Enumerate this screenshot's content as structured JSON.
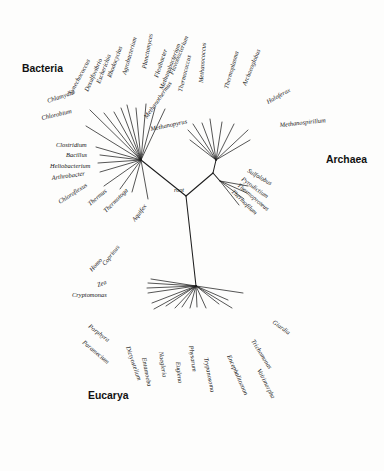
{
  "figure": {
    "type": "unrooted-phylogenetic-tree",
    "background_color": "#fdfdfc",
    "line_color": "#1d1d1d",
    "text_color": "#141414",
    "root_label": "root"
  },
  "domain_labels": [
    {
      "id": "bacteria",
      "text": "Bacteria",
      "x": 22,
      "y": 72
    },
    {
      "id": "archaea",
      "text": "Archaea",
      "x": 326,
      "y": 163
    },
    {
      "id": "eucarya",
      "text": "Eucarya",
      "x": 88,
      "y": 399
    }
  ],
  "nodes": {
    "root": {
      "x": 186,
      "y": 196,
      "label": "root",
      "label_x": 174,
      "label_y": 192
    },
    "bacteria_hub": {
      "x": 141,
      "y": 160
    },
    "archaea_hub": {
      "x": 213,
      "y": 173
    },
    "archaea_upper_hub": {
      "x": 216,
      "y": 160
    },
    "crenarchaeota_hub": {
      "x": 220,
      "y": 181
    },
    "eucarya_hub": {
      "x": 196,
      "y": 286
    },
    "eucarya_left_hub": {
      "x": 160,
      "y": 295
    }
  },
  "groups": [
    {
      "id": "bacteria",
      "label": "Bacteria",
      "hub": {
        "x": 141,
        "y": 160
      },
      "taxa": [
        {
          "name": "Chlamydia",
          "tx": 48,
          "ty": 103,
          "ex": 90,
          "ey": 110,
          "angle": -19
        },
        {
          "name": "Chlorobium",
          "tx": 42,
          "ty": 120,
          "ex": 86,
          "ey": 126,
          "angle": -13
        },
        {
          "name": "Synechococcus",
          "tx": 72,
          "ty": 95,
          "ex": 104,
          "ey": 113,
          "angle": -62
        },
        {
          "name": "Desulfovibrio",
          "tx": 88,
          "ty": 92,
          "ex": 114,
          "ey": 112,
          "angle": -66
        },
        {
          "name": "Escherichia",
          "tx": 100,
          "ty": 84,
          "ex": 121,
          "ey": 108,
          "angle": -69
        },
        {
          "name": "Rhodocyclus",
          "tx": 111,
          "ty": 78,
          "ex": 127,
          "ey": 105,
          "angle": -70
        },
        {
          "name": "Agrobacterium",
          "tx": 126,
          "ty": 75,
          "ex": 136,
          "ey": 108,
          "angle": -74
        },
        {
          "name": "Planctomyces",
          "tx": 146,
          "ty": 69,
          "ex": 146,
          "ey": 104,
          "angle": -79
        },
        {
          "name": "Flexibacter",
          "tx": 158,
          "ty": 78,
          "ex": 155,
          "ey": 108,
          "angle": -72
        },
        {
          "name": "Flavobacterium",
          "tx": 173,
          "ty": 75,
          "ex": 165,
          "ey": 109,
          "angle": -68
        },
        {
          "name": "Clostridium",
          "tx": 56,
          "ty": 147,
          "ex": 96,
          "ey": 147,
          "angle": 0
        },
        {
          "name": "Bacillus",
          "tx": 66,
          "ty": 157,
          "ex": 100,
          "ey": 155,
          "angle": 0
        },
        {
          "name": "Heliobacterium",
          "tx": 50,
          "ty": 168,
          "ex": 98,
          "ey": 163,
          "angle": 0
        },
        {
          "name": "Arthrobacter",
          "tx": 52,
          "ty": 180,
          "ex": 100,
          "ey": 172,
          "angle": -8
        },
        {
          "name": "Chloroflexus",
          "tx": 60,
          "ty": 204,
          "ex": 104,
          "ey": 186,
          "angle": -33
        },
        {
          "name": "Thermus",
          "tx": 90,
          "ty": 206,
          "ex": 120,
          "ey": 189,
          "angle": -40
        },
        {
          "name": "Thermotoga",
          "tx": 106,
          "ty": 213,
          "ex": 132,
          "ey": 192,
          "angle": -45
        },
        {
          "name": "Aquifex",
          "tx": 135,
          "ty": 222,
          "ex": 148,
          "ey": 199,
          "angle": -53
        }
      ]
    },
    {
      "id": "archaea_euryarchaeota",
      "label": "Archaea (Euryarchaeota)",
      "hub": {
        "x": 216,
        "y": 160
      },
      "taxa": [
        {
          "name": "Methanopyrus",
          "tx": 151,
          "ty": 131,
          "ex": 190,
          "ey": 140,
          "angle": -12
        },
        {
          "name": "Methanothermus",
          "tx": 147,
          "ty": 119,
          "ex": 188,
          "ey": 130,
          "angle": -55
        },
        {
          "name": "Methanobacterium",
          "tx": 163,
          "ty": 90,
          "ex": 193,
          "ey": 124,
          "angle": -69
        },
        {
          "name": "Thermococcus",
          "tx": 182,
          "ty": 92,
          "ex": 202,
          "ey": 123,
          "angle": -76
        },
        {
          "name": "Methanococcus",
          "tx": 203,
          "ty": 83,
          "ex": 210,
          "ey": 119,
          "angle": -86
        },
        {
          "name": "Thermoplasma",
          "tx": 228,
          "ty": 89,
          "ex": 222,
          "ey": 122,
          "angle": -74
        },
        {
          "name": "Archaeoglobus",
          "tx": 246,
          "ty": 86,
          "ex": 234,
          "ey": 124,
          "angle": -68
        },
        {
          "name": "Haloferax",
          "tx": 268,
          "ty": 104,
          "ex": 248,
          "ey": 130,
          "angle": -29
        },
        {
          "name": "Methanospirillum",
          "tx": 280,
          "ty": 127,
          "ex": 250,
          "ey": 140,
          "angle": -6
        }
      ]
    },
    {
      "id": "archaea_crenarchaeota",
      "label": "Archaea (Crenarchaeota)",
      "hub": {
        "x": 220,
        "y": 181
      },
      "taxa": [
        {
          "name": "Sulfolobus",
          "tx": 247,
          "ty": 172,
          "ex": 248,
          "ey": 186,
          "angle": 30
        },
        {
          "name": "Pyrodictium",
          "tx": 241,
          "ty": 180,
          "ex": 247,
          "ey": 193,
          "angle": 36
        },
        {
          "name": "Thermoproteus",
          "tx": 237,
          "ty": 186,
          "ex": 244,
          "ey": 199,
          "angle": 40
        },
        {
          "name": "Thermofilum",
          "tx": 231,
          "ty": 192,
          "ex": 239,
          "ey": 205,
          "angle": 44
        }
      ]
    },
    {
      "id": "eucarya",
      "label": "Eucarya",
      "hub": {
        "x": 196,
        "y": 286
      },
      "taxa": [
        {
          "name": "Coprinus",
          "tx": 105,
          "ty": 266,
          "ex": 151,
          "ey": 279,
          "angle": -52
        },
        {
          "name": "Homo",
          "tx": 92,
          "ty": 272,
          "ex": 148,
          "ey": 283,
          "angle": -48
        },
        {
          "name": "Zea",
          "tx": 98,
          "ty": 287,
          "ex": 147,
          "ey": 288,
          "angle": -20
        },
        {
          "name": "Cryptomonas",
          "tx": 72,
          "ty": 297,
          "ex": 148,
          "ey": 293,
          "angle": 0
        },
        {
          "name": "Porphyra",
          "tx": 88,
          "ty": 327,
          "ex": 152,
          "ey": 303,
          "angle": 38
        },
        {
          "name": "Paramecium",
          "tx": 82,
          "ty": 343,
          "ex": 154,
          "ey": 309,
          "angle": 40
        },
        {
          "name": "Dictyostelium",
          "tx": 126,
          "ty": 347,
          "ex": 166,
          "ey": 306,
          "angle": 71
        },
        {
          "name": "Entamoeba",
          "tx": 142,
          "ty": 358,
          "ex": 175,
          "ey": 308,
          "angle": 79
        },
        {
          "name": "Naegleria",
          "tx": 159,
          "ty": 352,
          "ex": 182,
          "ey": 307,
          "angle": 82
        },
        {
          "name": "Euglena",
          "tx": 176,
          "ty": 362,
          "ex": 190,
          "ey": 308,
          "angle": 84
        },
        {
          "name": "Physarum",
          "tx": 189,
          "ty": 346,
          "ex": 197,
          "ey": 307,
          "angle": 82
        },
        {
          "name": "Trypanosoma",
          "tx": 204,
          "ty": 358,
          "ex": 206,
          "ey": 308,
          "angle": 79
        },
        {
          "name": "Encephalitozoon",
          "tx": 227,
          "ty": 356,
          "ex": 219,
          "ey": 304,
          "angle": 66
        },
        {
          "name": "Vairimorpha",
          "tx": 257,
          "ty": 370,
          "ex": 232,
          "ey": 308,
          "angle": 63
        },
        {
          "name": "Trichomonas",
          "tx": 251,
          "ty": 341,
          "ex": 228,
          "ey": 300,
          "angle": 58
        },
        {
          "name": "Giardia",
          "tx": 272,
          "ty": 323,
          "ex": 243,
          "ey": 293,
          "angle": 36
        }
      ]
    }
  ]
}
